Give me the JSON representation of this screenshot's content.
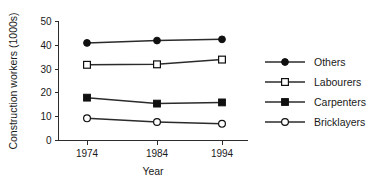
{
  "chart_data": {
    "type": "line",
    "title": "",
    "xlabel": "Year",
    "ylabel": "Construction workers (1000s)",
    "categories": [
      "1974",
      "1984",
      "1994"
    ],
    "x": [
      1974,
      1984,
      1994
    ],
    "xtick_labels": [
      "1974",
      "1984",
      "1994"
    ],
    "ytick_labels": [
      "0",
      "10",
      "20",
      "30",
      "40",
      "50"
    ],
    "yticks": [
      0,
      10,
      20,
      30,
      40,
      50
    ],
    "ylim": [
      0,
      50
    ],
    "grid": false,
    "legend_position": "right",
    "series": [
      {
        "name": "Others",
        "marker": "filled-circle",
        "values": [
          41,
          42,
          42.5
        ]
      },
      {
        "name": "Labourers",
        "marker": "open-square",
        "values": [
          31.8,
          32,
          34
        ]
      },
      {
        "name": "Carpenters",
        "marker": "filled-square",
        "values": [
          18,
          15.5,
          16
        ]
      },
      {
        "name": "Bricklayers",
        "marker": "open-circle",
        "values": [
          9.3,
          7.8,
          7
        ]
      }
    ],
    "colors": {
      "line": "#2b2b2b",
      "marker_fill": "#101010",
      "marker_open_fill": "#ffffff",
      "axis": "#2b2b2b",
      "text": "#1a1a1a",
      "background": "#ffffff"
    }
  },
  "legend": {
    "items": [
      {
        "label": "Others"
      },
      {
        "label": "Labourers"
      },
      {
        "label": "Carpenters"
      },
      {
        "label": "Bricklayers"
      }
    ]
  },
  "axes": {
    "x_title": "Year",
    "y_title": "Construction workers (1000s)"
  }
}
